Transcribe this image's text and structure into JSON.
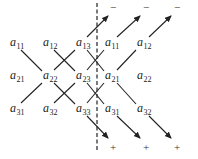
{
  "diagram": {
    "title": "",
    "rows": [
      [
        {
          "base": "a",
          "sub": "11",
          "x": 10,
          "y": 46
        },
        {
          "base": "a",
          "sub": "12",
          "x": 43,
          "y": 46
        },
        {
          "base": "a",
          "sub": "13",
          "x": 76,
          "y": 46
        },
        {
          "base": "a",
          "sub": "11",
          "x": 105,
          "y": 46
        },
        {
          "base": "a",
          "sub": "12",
          "x": 137,
          "y": 46
        }
      ],
      [
        {
          "base": "a",
          "sub": "21",
          "x": 10,
          "y": 79
        },
        {
          "base": "a",
          "sub": "22",
          "x": 43,
          "y": 79
        },
        {
          "base": "a",
          "sub": "23",
          "x": 76,
          "y": 79
        },
        {
          "base": "a",
          "sub": "21",
          "x": 105,
          "y": 79
        },
        {
          "base": "a",
          "sub": "22",
          "x": 137,
          "y": 79
        }
      ],
      [
        {
          "base": "a",
          "sub": "31",
          "x": 10,
          "y": 112
        },
        {
          "base": "a",
          "sub": "32",
          "x": 43,
          "y": 112
        },
        {
          "base": "a",
          "sub": "33",
          "x": 76,
          "y": 112
        },
        {
          "base": "a",
          "sub": "31",
          "x": 105,
          "y": 112
        },
        {
          "base": "a",
          "sub": "32",
          "x": 137,
          "y": 112
        }
      ]
    ],
    "minus_signs": [
      {
        "text": "−",
        "x": 110,
        "y": 11
      },
      {
        "text": "−",
        "x": 143,
        "y": 11
      },
      {
        "text": "−",
        "x": 174,
        "y": 11
      }
    ],
    "plus_signs": [
      {
        "text": "+",
        "x": 110,
        "y": 151
      },
      {
        "text": "+",
        "x": 143,
        "y": 151
      },
      {
        "text": "+",
        "x": 174,
        "y": 151
      }
    ],
    "separator": {
      "x": 97,
      "y1": 3,
      "y2": 152,
      "style": "dashed"
    }
  }
}
